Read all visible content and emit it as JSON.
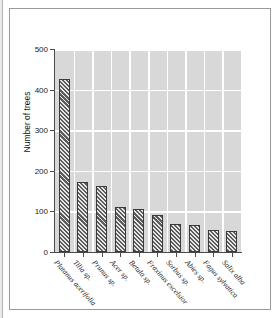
{
  "chart_data": {
    "type": "bar",
    "title": "",
    "xlabel": "",
    "ylabel": "Number of trees",
    "ylim": [
      0,
      500
    ],
    "yticks": [
      0,
      100,
      200,
      300,
      400,
      500
    ],
    "grid": "horizontal-and-vertical-white-on-gray",
    "legend": "none",
    "categories": [
      "Platanus acerifolia",
      "Tilia sp.",
      "Prunus sp.",
      "Acer sp.",
      "Betula sp.",
      "Fraxinus excelsior",
      "Sorbus sp.",
      "Abies sp.",
      "Fagus sylvatica",
      "Salix alba"
    ],
    "values": [
      425,
      172,
      162,
      112,
      107,
      92,
      70,
      67,
      53,
      51
    ],
    "bar_style": {
      "fill": "#5d5d5d",
      "hatch": "diagonal",
      "edge": "#3a3a3a"
    },
    "plot_background": "#d8d8d8",
    "gridline_color": "#ffffff"
  }
}
